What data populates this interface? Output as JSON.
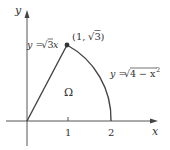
{
  "diagram": {
    "axes": {
      "x_label": "x",
      "y_label": "y",
      "ticks": [
        {
          "label": "1",
          "value": 1
        },
        {
          "label": "2",
          "value": 2
        }
      ]
    },
    "curves": [
      {
        "name": "line",
        "equation_lhs": "y = ",
        "equation_rhs": "3",
        "equation_tail": " x",
        "display": "y = √3 x"
      },
      {
        "name": "arc",
        "equation_lhs": "y = ",
        "equation_rhs": "4 − x",
        "equation_sup": "2",
        "display": "y = √(4 − x²)"
      }
    ],
    "point": {
      "label_prefix": "(1, ",
      "label_root": "3",
      "label_suffix": ")",
      "display": "(1, √3)"
    },
    "region_label": "Ω",
    "colors": {
      "stroke": "#444444",
      "axis": "#555555",
      "text": "#333333"
    }
  }
}
